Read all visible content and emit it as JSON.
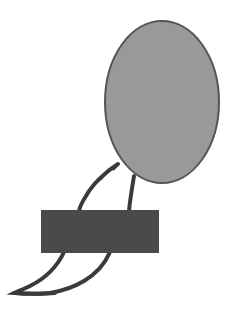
{
  "drawing": {
    "background": "#ffffff",
    "oval": {
      "cx": 162,
      "cy": 102,
      "rx": 57,
      "ry": 81,
      "fill": "#999999",
      "stroke": "#555555"
    },
    "rectangle": {
      "x": 41,
      "y": 210,
      "width": 118,
      "height": 43,
      "fill": "#4a4a4a"
    },
    "stroke_color": "#3a3a3a"
  }
}
